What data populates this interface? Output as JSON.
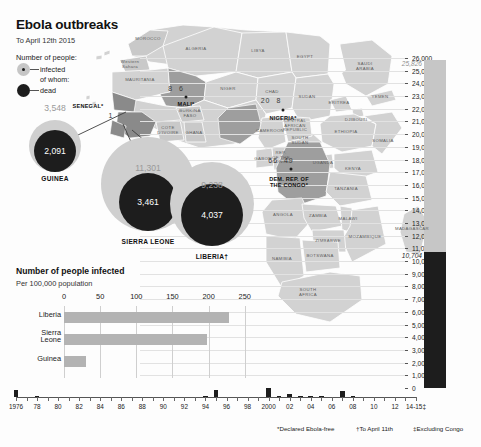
{
  "header": {
    "title": "Ebola outbreaks",
    "subtitle": "To April 12th 2015"
  },
  "legend": {
    "heading": "Number of people:",
    "infected_label": "infected",
    "ofwhom_label": "of whom:",
    "dead_label": "dead"
  },
  "bubbles": [
    {
      "name": "GUINEA",
      "infected": "3,548",
      "dead": "2,091",
      "infected_num": 3548,
      "dead_num": 2091
    },
    {
      "name": "SIERRA LEONE",
      "infected": "11,301",
      "dead": "3,461",
      "infected_num": 11301,
      "dead_num": 3461
    },
    {
      "name": "LIBERIA†",
      "infected": "9,238",
      "dead": "4,037",
      "infected_num": 9238,
      "dead_num": 4037
    }
  ],
  "small_outbreaks": [
    {
      "name": "MALI*",
      "infected": "8",
      "dead": "6"
    },
    {
      "name": "NIGERIA*",
      "infected": "20",
      "dead": "8"
    },
    {
      "name": "DEM. REP. OF THE CONGO*",
      "infected": "66",
      "dead": "49"
    },
    {
      "name": "SENEGAL*",
      "infected": "1",
      "dead": ""
    }
  ],
  "map_countries": [
    "MOROCCO",
    "ALGERIA",
    "LIBYA",
    "EGYPT",
    "Western Sahara",
    "MAURITANIA",
    "NIGER",
    "CHAD",
    "SUDAN",
    "SAUDI ARABIA",
    "ERITREA",
    "YEMEN",
    "DJIBOUTI",
    "ETHIOPIA",
    "SOMALIA",
    "SOUTH SUDAN",
    "UGANDA",
    "KENYA",
    "BURKINA FASO",
    "COTE D'IVOIRE",
    "GHANA",
    "CAMEROON",
    "CENTRAL AFRICAN REPUBLIC",
    "GABON",
    "REP. OF THE CONGO",
    "TANZANIA",
    "ANGOLA",
    "ZAMBIA",
    "MALAWI",
    "ZIMBABWE",
    "NAMIBIA",
    "BOTSWANA",
    "MOZAMBIQUE",
    "MADAGASCAR",
    "SOUTH AFRICA"
  ],
  "chart_data": [
    {
      "type": "bar",
      "orientation": "horizontal",
      "title": "Number of people infected",
      "subtitle": "Per 100,000 population",
      "categories": [
        "Liberia",
        "Sierra Leone",
        "Guinea"
      ],
      "values": [
        228,
        198,
        30
      ],
      "xlabel": "",
      "ylabel": "",
      "xlim": [
        0,
        260
      ],
      "ticks": [
        0,
        50,
        100,
        150,
        200,
        250
      ],
      "tick_labels": [
        "0",
        "50",
        "100",
        "150",
        "200",
        "250"
      ],
      "grid": true,
      "legend": "none"
    },
    {
      "type": "bar",
      "orientation": "vertical",
      "title": "",
      "categories": [
        "1976",
        "77",
        "78",
        "79",
        "80",
        "81",
        "82",
        "83",
        "84",
        "85",
        "86",
        "87",
        "88",
        "89",
        "90",
        "91",
        "92",
        "93",
        "94",
        "95",
        "96",
        "97",
        "98",
        "99",
        "2000",
        "01",
        "02",
        "03",
        "04",
        "05",
        "06",
        "07",
        "08",
        "09",
        "10",
        "11",
        "12",
        "13",
        "14-15‡"
      ],
      "tick_labels": [
        "1976",
        "78",
        "80",
        "82",
        "84",
        "86",
        "88",
        "90",
        "92",
        "94",
        "96",
        "98",
        "2000",
        "02",
        "04",
        "06",
        "08",
        "10",
        "12",
        "14-15‡"
      ],
      "series": [
        {
          "name": "infected",
          "values": [
            318,
            0,
            34,
            0,
            0,
            0,
            0,
            0,
            0,
            0,
            0,
            0,
            0,
            0,
            0,
            0,
            0,
            0,
            52,
            315,
            0,
            0,
            0,
            0,
            425,
            57,
            143,
            35,
            17,
            12,
            0,
            264,
            32,
            0,
            0,
            0,
            0,
            0,
            25826
          ]
        },
        {
          "name": "dead",
          "values": [
            280,
            0,
            22,
            0,
            0,
            0,
            0,
            0,
            0,
            0,
            0,
            0,
            0,
            0,
            0,
            0,
            0,
            0,
            31,
            254,
            0,
            0,
            0,
            0,
            224,
            43,
            128,
            29,
            7,
            10,
            0,
            187,
            14,
            0,
            0,
            0,
            0,
            0,
            10704
          ]
        }
      ],
      "ylim": [
        0,
        26000
      ],
      "ytick_labels": [
        "0",
        "1,000",
        "2,000",
        "3,000",
        "4,000",
        "5,000",
        "6,000",
        "7,000",
        "8,000",
        "9,000",
        "10,000",
        "11,000",
        "12,000",
        "13,000",
        "14,000",
        "15,000",
        "16,000",
        "17,000",
        "18,000",
        "19,000",
        "20,000",
        "21,000",
        "22,000",
        "23,000",
        "24,000",
        "25,000",
        "26,000"
      ],
      "annotations": [
        {
          "text": "25,826",
          "value": 25826,
          "style": "grey-italic"
        },
        {
          "text": "10,704",
          "value": 10704,
          "style": "dark-italic"
        }
      ],
      "grid": true,
      "legend": "none"
    }
  ],
  "footnotes": [
    "*Declared Ebola-free",
    "†To April 11th",
    "‡Excluding Congo"
  ]
}
